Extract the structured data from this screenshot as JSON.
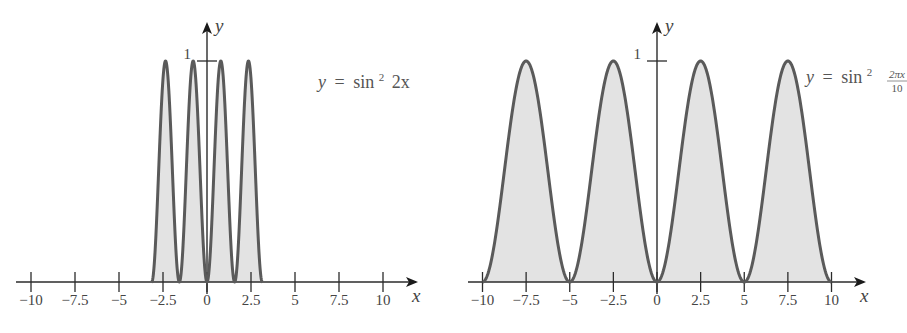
{
  "chart_data": [
    {
      "type": "area",
      "title": "",
      "function": "y = sin^2(2x)",
      "formula_label": {
        "y": "y",
        "eq": "=",
        "fn": "sin",
        "exp": "2",
        "arg": "2x"
      },
      "xlabel": "x",
      "ylabel": "y",
      "xlim": [
        -10,
        10
      ],
      "ylim": [
        0,
        1
      ],
      "domain_shaded": [
        -3.14159,
        3.14159
      ],
      "x_ticks": [
        -10,
        -7.5,
        -5,
        -2.5,
        0,
        2.5,
        5,
        7.5,
        10
      ],
      "x_tick_labels": [
        "−10",
        "−7.5",
        "−5",
        "−2.5",
        "0",
        "2.5",
        "5",
        "7.5",
        "10"
      ],
      "y_ticks": [
        1
      ],
      "y_tick_labels": [
        "1"
      ],
      "peaks_x": [
        -2.356,
        -0.785,
        0.785,
        2.356
      ],
      "zeros_x": [
        -3.14159,
        -1.5708,
        0,
        1.5708,
        3.14159
      ],
      "grid": false,
      "legend": null,
      "fill_color": "#e3e3e3",
      "line_color": "#5a5a5a"
    },
    {
      "type": "area",
      "title": "",
      "function": "y = sin^2(2*pi*x/10)",
      "formula_label": {
        "y": "y",
        "eq": "=",
        "fn": "sin",
        "exp": "2",
        "num": "2πx",
        "den": "10"
      },
      "xlabel": "x",
      "ylabel": "y",
      "xlim": [
        -10,
        10
      ],
      "ylim": [
        0,
        1
      ],
      "domain_shaded": [
        -10,
        10
      ],
      "x_ticks": [
        -10,
        -7.5,
        -5,
        -2.5,
        0,
        2.5,
        5,
        7.5,
        10
      ],
      "x_tick_labels": [
        "−10",
        "−7.5",
        "−5",
        "−2.5",
        "0",
        "2.5",
        "5",
        "7.5",
        "10"
      ],
      "y_ticks": [
        1
      ],
      "y_tick_labels": [
        "1"
      ],
      "peaks_x": [
        -7.5,
        -2.5,
        2.5,
        7.5
      ],
      "zeros_x": [
        -10,
        -5,
        0,
        5,
        10
      ],
      "grid": false,
      "legend": null,
      "fill_color": "#e3e3e3",
      "line_color": "#5a5a5a"
    }
  ],
  "layout": {
    "panels": [
      {
        "x0_px": 207,
        "axis_y_px": 282,
        "px_per_unit_x": 17.6,
        "px_per_unit_y": 221,
        "x_axis_start": 16,
        "x_axis_end": 416,
        "y_axis_top": 24
      },
      {
        "x0_px": 657,
        "axis_y_px": 282,
        "px_per_unit_x": 17.45,
        "px_per_unit_y": 221,
        "x_axis_start": 468,
        "x_axis_end": 864,
        "y_axis_top": 24
      }
    ]
  }
}
